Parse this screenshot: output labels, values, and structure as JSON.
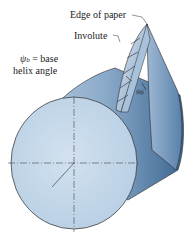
{
  "figure": {
    "labels": {
      "edge_of_paper": "Edge of paper",
      "involute": "Involute",
      "psi_symbol": "ψ",
      "psi_subscript": "b",
      "psi_eq": " = base",
      "helix_angle": "helix angle",
      "angle_marker": "ψb"
    },
    "colors": {
      "cylinder_face": "#c5d8ea",
      "cylinder_side_light": "#9fbad6",
      "cylinder_side_dark": "#3f6690",
      "paper_light": "#dbe6f1",
      "paper_dark": "#6f93b8",
      "outline": "#2a2a2a"
    }
  }
}
